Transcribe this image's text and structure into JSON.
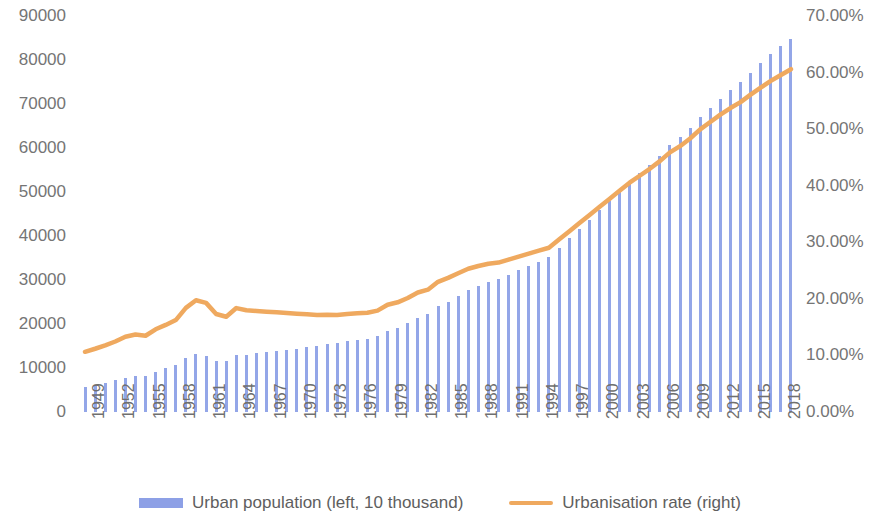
{
  "chart_data": {
    "type": "bar",
    "title": "",
    "subtitle": "",
    "xlabel": "",
    "ylabel": "",
    "grid": false,
    "legend_position": "bottom",
    "x": [
      1949,
      1950,
      1951,
      1952,
      1953,
      1954,
      1955,
      1956,
      1957,
      1958,
      1959,
      1960,
      1961,
      1962,
      1963,
      1964,
      1965,
      1966,
      1967,
      1968,
      1969,
      1970,
      1971,
      1972,
      1973,
      1974,
      1975,
      1976,
      1977,
      1978,
      1979,
      1980,
      1981,
      1982,
      1983,
      1984,
      1985,
      1986,
      1987,
      1988,
      1989,
      1990,
      1991,
      1992,
      1993,
      1994,
      1995,
      1996,
      1997,
      1998,
      1999,
      2000,
      2001,
      2002,
      2003,
      2004,
      2005,
      2006,
      2007,
      2008,
      2009,
      2010,
      2011,
      2012,
      2013,
      2014,
      2015,
      2016,
      2017,
      2018,
      2019
    ],
    "categories": [
      "1949",
      "1950",
      "1951",
      "1952",
      "1953",
      "1954",
      "1955",
      "1956",
      "1957",
      "1958",
      "1959",
      "1960",
      "1961",
      "1962",
      "1963",
      "1964",
      "1965",
      "1966",
      "1967",
      "1968",
      "1969",
      "1970",
      "1971",
      "1972",
      "1973",
      "1974",
      "1975",
      "1976",
      "1977",
      "1978",
      "1979",
      "1980",
      "1981",
      "1982",
      "1983",
      "1984",
      "1985",
      "1986",
      "1987",
      "1988",
      "1989",
      "1990",
      "1991",
      "1992",
      "1993",
      "1994",
      "1995",
      "1996",
      "1997",
      "1998",
      "1999",
      "2000",
      "2001",
      "2002",
      "2003",
      "2004",
      "2005",
      "2006",
      "2007",
      "2008",
      "2009",
      "2010",
      "2011",
      "2012",
      "2013",
      "2014",
      "2015",
      "2016",
      "2017",
      "2018",
      "2019"
    ],
    "xtick_labels": [
      "1949",
      "1952",
      "1955",
      "1958",
      "1961",
      "1964",
      "1967",
      "1970",
      "1973",
      "1976",
      "1979",
      "1982",
      "1985",
      "1988",
      "1991",
      "1994",
      "1997",
      "2000",
      "2003",
      "2006",
      "2009",
      "2012",
      "2015",
      "2018"
    ],
    "xtick_step_years": 3,
    "yaxis_left": {
      "label": "",
      "ylim": [
        0,
        90000
      ],
      "ticks": [
        0,
        10000,
        20000,
        30000,
        40000,
        50000,
        60000,
        70000,
        80000,
        90000
      ],
      "tick_labels": [
        "0",
        "10000",
        "20000",
        "30000",
        "40000",
        "50000",
        "60000",
        "70000",
        "80000",
        "90000"
      ],
      "unit": "10 thousand"
    },
    "yaxis_right": {
      "label": "",
      "ylim": [
        0,
        70
      ],
      "ticks": [
        0,
        10,
        20,
        30,
        40,
        50,
        60,
        70
      ],
      "tick_labels": [
        "0.00%",
        "10.00%",
        "20.00%",
        "30.00%",
        "40.00%",
        "50.00%",
        "60.00%",
        "70.00%"
      ],
      "unit": "%"
    },
    "series": [
      {
        "name": "Urban population (left, 10 thousand)",
        "type": "bar",
        "axis": "left",
        "color": "#93a6e8",
        "values": [
          5765,
          6169,
          6632,
          7163,
          7826,
          8249,
          8285,
          9185,
          9949,
          10721,
          12371,
          13073,
          12707,
          11659,
          11646,
          12950,
          13045,
          13313,
          13548,
          13838,
          14117,
          14424,
          14711,
          14935,
          15345,
          15595,
          16030,
          16341,
          16669,
          17245,
          18495,
          19140,
          20171,
          21480,
          22274,
          24017,
          25094,
          26366,
          27674,
          28661,
          29540,
          30195,
          31203,
          32175,
          33173,
          34169,
          35174,
          37304,
          39449,
          41608,
          43748,
          45906,
          48064,
          50212,
          52376,
          54283,
          56212,
          58288,
          60633,
          62403,
          64512,
          66978,
          69079,
          71182,
          73111,
          74916,
          77116,
          79298,
          81347,
          83137,
          84843
        ]
      },
      {
        "name": "Urbanisation rate (right)",
        "type": "line",
        "axis": "right",
        "color": "#efa95f",
        "values": [
          10.64,
          11.18,
          11.78,
          12.46,
          13.31,
          13.69,
          13.48,
          14.62,
          15.39,
          16.25,
          18.41,
          19.75,
          19.29,
          17.33,
          16.84,
          18.37,
          17.98,
          17.86,
          17.74,
          17.62,
          17.5,
          17.38,
          17.26,
          17.13,
          17.2,
          17.16,
          17.34,
          17.44,
          17.55,
          17.92,
          18.96,
          19.39,
          20.16,
          21.13,
          21.62,
          23.01,
          23.71,
          24.52,
          25.32,
          25.81,
          26.21,
          26.41,
          26.94,
          27.46,
          27.99,
          28.51,
          29.04,
          30.48,
          31.91,
          33.35,
          34.78,
          36.22,
          37.66,
          39.09,
          40.53,
          41.76,
          42.99,
          44.34,
          45.89,
          46.99,
          48.34,
          49.95,
          51.27,
          52.57,
          53.73,
          54.77,
          56.1,
          57.35,
          58.52,
          59.58,
          60.6
        ]
      }
    ]
  },
  "legend": {
    "items": [
      {
        "label": "Urban population (left, 10 thousand)",
        "marker": "bar-swatch",
        "color": "#8da0e6"
      },
      {
        "label": "Urbanisation rate (right)",
        "marker": "line-swatch",
        "color": "#efa95f"
      }
    ]
  }
}
